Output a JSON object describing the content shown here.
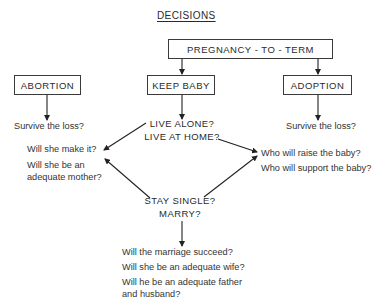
{
  "title": "DECISIONS",
  "nodes": {
    "root": "PREGNANCY - TO - TERM",
    "abortion": "ABORTION",
    "keep_baby": "KEEP BABY",
    "adoption": "ADOPTION"
  },
  "abortion_question": "Survive the loss?",
  "adoption_question": "Survive the loss?",
  "living": {
    "line1": "LIVE ALONE?",
    "line2": "LIVE AT HOME?"
  },
  "marital": {
    "line1": "STAY SINGLE?",
    "line2": "MARRY?"
  },
  "mother_questions": {
    "q1": "Will she make it?",
    "q2_line1": "Will she be an",
    "q2_line2": "adequate mother?"
  },
  "support_questions": {
    "q1": "Who will raise the baby?",
    "q2": "Who will support the baby?"
  },
  "marriage_questions": {
    "q1": "Will the marriage succeed?",
    "q2": "Will she be an adequate wife?",
    "q3_line1": "Will he be an adequate father",
    "q3_line2": "and husband?"
  }
}
